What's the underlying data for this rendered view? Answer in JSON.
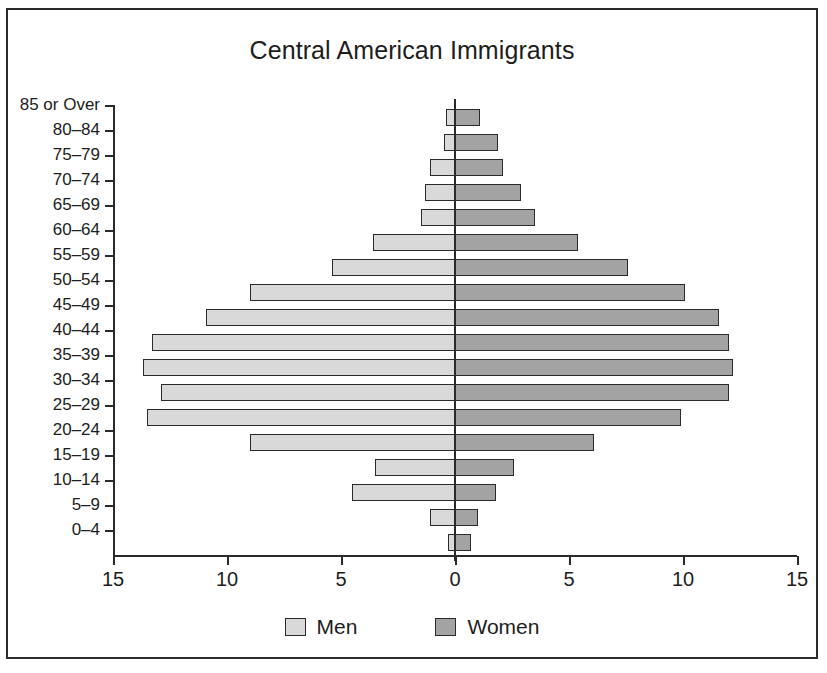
{
  "chart_data": {
    "type": "bar",
    "subtype": "population-pyramid",
    "title": "Central American Immigrants",
    "xlabel": "",
    "ylabel": "",
    "categories": [
      "85 or Over",
      "80–84",
      "75–79",
      "70–74",
      "65–69",
      "60–64",
      "55–59",
      "50–54",
      "45–49",
      "40–44",
      "35–39",
      "30–34",
      "25–29",
      "20–24",
      "15–19",
      "10–14",
      "5–9",
      "0–4"
    ],
    "series": [
      {
        "name": "Men",
        "side": "left",
        "color": "#d9d9d9",
        "values": [
          0.4,
          0.5,
          1.1,
          1.3,
          1.5,
          3.6,
          5.4,
          9.0,
          10.9,
          13.3,
          13.7,
          12.9,
          13.5,
          9.0,
          3.5,
          4.5,
          1.1,
          0.3
        ]
      },
      {
        "name": "Women",
        "side": "right",
        "color": "#a3a3a3",
        "values": [
          1.1,
          1.9,
          2.1,
          2.9,
          3.5,
          5.4,
          7.6,
          10.1,
          11.6,
          12.0,
          12.2,
          12.0,
          9.9,
          6.1,
          2.6,
          1.8,
          1.0,
          0.7
        ]
      }
    ],
    "xticks": [
      -15,
      -10,
      -5,
      0,
      5,
      10,
      15
    ],
    "xtick_labels": [
      "15",
      "10",
      "5",
      "0",
      "5",
      "10",
      "15"
    ],
    "xlim": [
      -15,
      15
    ],
    "grid": false,
    "legend_position": "bottom",
    "legend": [
      "Men",
      "Women"
    ]
  },
  "legend": {
    "men_label": "Men",
    "women_label": "Women",
    "men_swatch": "legend-swatch-men",
    "women_swatch": "legend-swatch-women"
  }
}
